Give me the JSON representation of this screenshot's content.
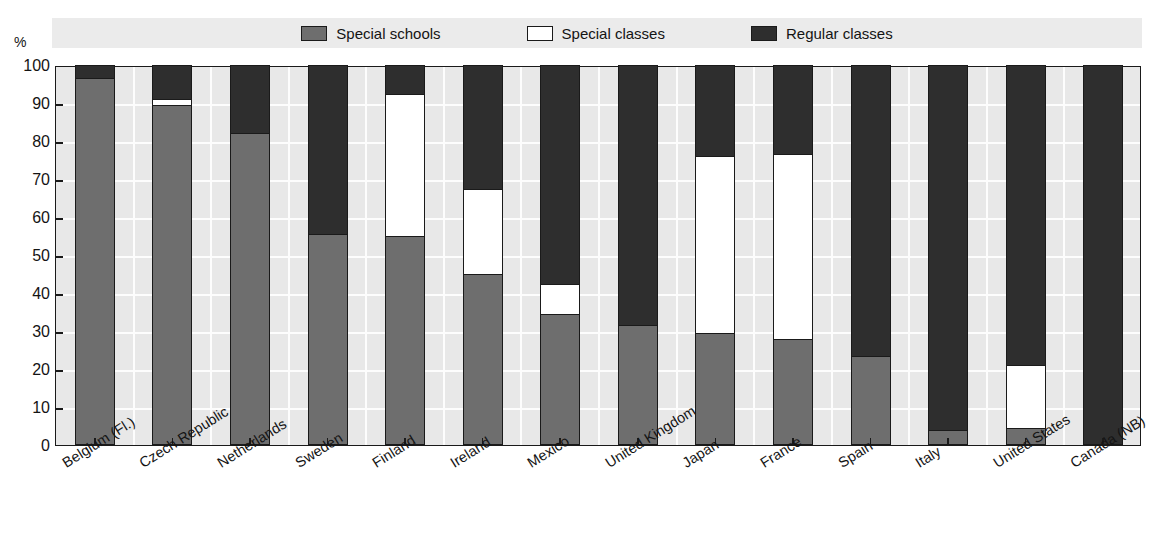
{
  "axis": {
    "y_unit_label": "%",
    "y_ticks": [
      0,
      10,
      20,
      30,
      40,
      50,
      60,
      70,
      80,
      90,
      100
    ]
  },
  "legend": {
    "items": [
      {
        "label": "Special schools",
        "color": "#6e6e6e",
        "key": "special_schools"
      },
      {
        "label": "Special classes",
        "color": "#ffffff",
        "key": "special_classes"
      },
      {
        "label": "Regular classes",
        "color": "#2e2e2e",
        "key": "regular_classes"
      }
    ]
  },
  "colors": {
    "special_schools": "#6e6e6e",
    "special_classes": "#ffffff",
    "regular_classes": "#2e2e2e",
    "plot_background": "#e8e8e8",
    "legend_background": "#ebebeb",
    "gridline": "#fdfdfd",
    "axis": "#1a1a1a",
    "text": "#141414"
  },
  "chart_data": {
    "type": "bar",
    "subtype": "stacked-bar-100",
    "title": "",
    "xlabel": "",
    "ylabel": "%",
    "ylim": [
      0,
      100
    ],
    "yticks": [
      0,
      10,
      20,
      30,
      40,
      50,
      60,
      70,
      80,
      90,
      100
    ],
    "grid": true,
    "legend_position": "top-center",
    "categories": [
      "Belgium (Fl.)",
      "Czech Republic",
      "Netherlands",
      "Sweden",
      "Finland",
      "Ireland",
      "Mexico",
      "United Kingdom",
      "Japan",
      "France",
      "Spain",
      "Italy",
      "United States",
      "Canada (NB)"
    ],
    "series": [
      {
        "name": "Special schools",
        "color": "#6e6e6e",
        "values": [
          96.5,
          89.5,
          82.0,
          55.5,
          55.0,
          45.0,
          34.5,
          31.5,
          29.5,
          28.0,
          23.5,
          4.0,
          4.5,
          0.0
        ]
      },
      {
        "name": "Special classes",
        "color": "#ffffff",
        "values": [
          0.0,
          1.5,
          0.0,
          0.0,
          37.5,
          22.5,
          8.0,
          0.0,
          46.5,
          48.5,
          0.0,
          0.0,
          16.5,
          0.0
        ]
      },
      {
        "name": "Regular classes",
        "color": "#2e2e2e",
        "values": [
          3.5,
          9.0,
          18.0,
          44.5,
          7.5,
          32.5,
          57.5,
          68.5,
          24.0,
          23.5,
          76.5,
          96.0,
          79.0,
          100.0
        ]
      }
    ]
  }
}
